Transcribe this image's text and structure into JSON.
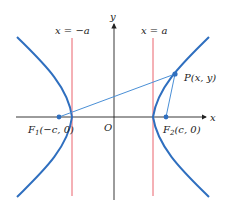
{
  "diagram": {
    "type": "hyperbola-foci",
    "axes": {
      "x_label": "x",
      "y_label": "y",
      "origin_label": "O"
    },
    "lines": [
      {
        "label": "x = −a",
        "color": "#e8505b"
      },
      {
        "label": "x = a",
        "color": "#e8505b"
      }
    ],
    "points": {
      "P": {
        "label": "P(x, y)"
      },
      "F1": {
        "name": "F",
        "sub": "1",
        "rest": "(−c, 0)"
      },
      "F2": {
        "name": "F",
        "sub": "2",
        "rest": "(c, 0)"
      }
    },
    "colors": {
      "curve": "#2f6fbf",
      "segment": "#4a8fd6",
      "axis": "#222222",
      "directrix": "#e8505b"
    }
  }
}
